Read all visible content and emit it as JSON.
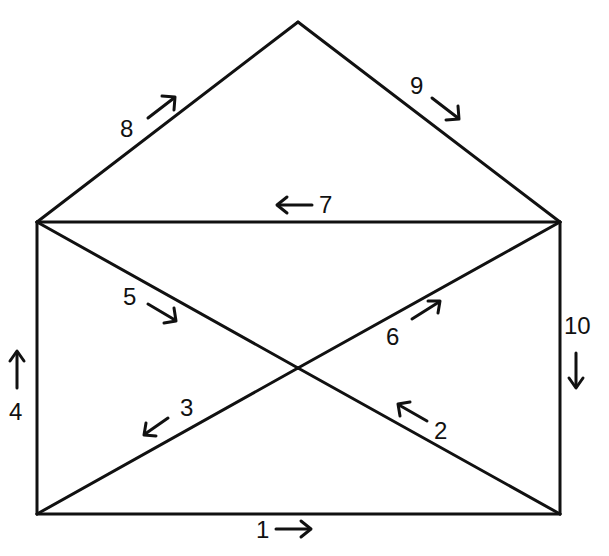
{
  "diagram": {
    "title": "",
    "nodes": [
      {
        "id": "apex",
        "x": 298,
        "y": 22
      },
      {
        "id": "top-left",
        "x": 37,
        "y": 222
      },
      {
        "id": "top-right",
        "x": 560,
        "y": 222
      },
      {
        "id": "bottom-left",
        "x": 37,
        "y": 514
      },
      {
        "id": "bottom-right",
        "x": 560,
        "y": 514
      },
      {
        "id": "center",
        "x": 298,
        "y": 368
      }
    ],
    "edges": [
      {
        "step": "1",
        "from": "bottom-left",
        "to": "bottom-right",
        "direction": "right"
      },
      {
        "step": "2",
        "from": "bottom-right",
        "to": "center",
        "direction": "up-left"
      },
      {
        "step": "3",
        "from": "center",
        "to": "bottom-left",
        "direction": "down-left"
      },
      {
        "step": "4",
        "from": "bottom-left",
        "to": "top-left",
        "direction": "up"
      },
      {
        "step": "5",
        "from": "top-left",
        "to": "center",
        "direction": "down-right"
      },
      {
        "step": "6",
        "from": "center",
        "to": "top-right",
        "direction": "up-right"
      },
      {
        "step": "7",
        "from": "top-right",
        "to": "top-left",
        "direction": "left"
      },
      {
        "step": "8",
        "from": "top-left",
        "to": "apex",
        "direction": "up-right"
      },
      {
        "step": "9",
        "from": "apex",
        "to": "top-right",
        "direction": "down-right"
      },
      {
        "step": "10",
        "from": "top-right",
        "to": "bottom-right",
        "direction": "down"
      }
    ],
    "labels": {
      "l1": "1",
      "l2": "2",
      "l3": "3",
      "l4": "4",
      "l5": "5",
      "l6": "6",
      "l7": "7",
      "l8": "8",
      "l9": "9",
      "l10": "10"
    },
    "colors": {
      "stroke": "#111111",
      "background": "#ffffff"
    }
  }
}
